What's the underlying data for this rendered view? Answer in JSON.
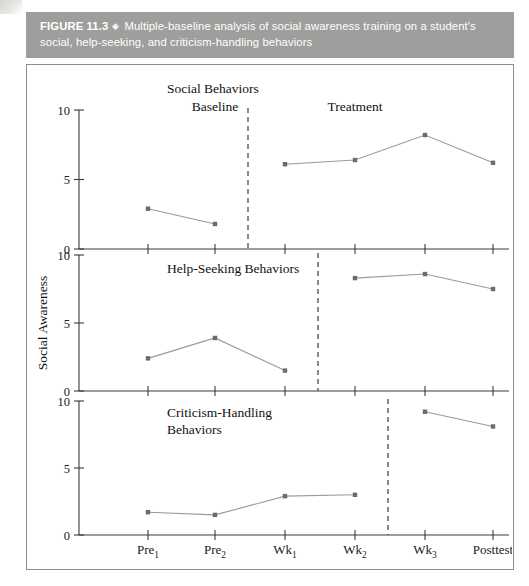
{
  "caption": {
    "figure_number": "FIGURE 11.3",
    "separator_icon": "diamond-bullet-icon",
    "separator_glyph": "◆",
    "text": "Multiple-baseline analysis of social awareness training on a student's social, help-seeking, and criticism-handling behaviors",
    "bar_color": "#9e9e9c",
    "text_color": "#ffffff"
  },
  "chart_data": {
    "type": "line",
    "title": "Multiple-baseline analysis of social awareness training on a student's social, help-seeking, and criticism-handling behaviors",
    "xlabel": "",
    "ylabel": "Social Awareness",
    "x": [
      "Pre1",
      "Pre2",
      "Wk1",
      "Wk2",
      "Wk3",
      "Posttest"
    ],
    "x_tick_labels": [
      {
        "base": "Pre",
        "sub": "1"
      },
      {
        "base": "Pre",
        "sub": "2"
      },
      {
        "base": "Wk",
        "sub": "1"
      },
      {
        "base": "Wk",
        "sub": "2"
      },
      {
        "base": "Wk",
        "sub": "3"
      },
      {
        "base": "Posttest",
        "sub": ""
      }
    ],
    "ylim": [
      0,
      10
    ],
    "y_ticks": [
      0,
      5,
      10
    ],
    "grid": false,
    "legend": "none",
    "marker": "square",
    "line_color": "#9a9a9a",
    "marker_color": "#6b6b6b",
    "panels": [
      {
        "name": "Social Behaviors",
        "title": "Social Behaviors",
        "phase_labels": [
          {
            "text": "Baseline",
            "at_x": "Pre2"
          },
          {
            "text": "Treatment",
            "at_x": "Wk2"
          }
        ],
        "phase_change_after": "Pre2",
        "segments": [
          {
            "phase": "Baseline",
            "x": [
              "Pre1",
              "Pre2"
            ],
            "values": [
              2.9,
              1.8
            ]
          },
          {
            "phase": "Treatment",
            "x": [
              "Wk1",
              "Wk2",
              "Wk3",
              "Posttest"
            ],
            "values": [
              6.1,
              6.4,
              8.2,
              6.2
            ]
          }
        ]
      },
      {
        "name": "Help-Seeking Behaviors",
        "title": "Help-Seeking Behaviors",
        "phase_labels": [],
        "phase_change_after": "Wk1",
        "segments": [
          {
            "phase": "Baseline",
            "x": [
              "Pre1",
              "Pre2",
              "Wk1"
            ],
            "values": [
              2.4,
              3.9,
              1.5
            ]
          },
          {
            "phase": "Treatment",
            "x": [
              "Wk2",
              "Wk3",
              "Posttest"
            ],
            "values": [
              8.3,
              8.6,
              7.5
            ]
          }
        ]
      },
      {
        "name": "Criticism-Handling Behaviors",
        "title": "Criticism-Handling Behaviors",
        "title_line1": "Criticism-Handling",
        "title_line2": "Behaviors",
        "phase_labels": [],
        "phase_change_after": "Wk2",
        "segments": [
          {
            "phase": "Baseline",
            "x": [
              "Pre1",
              "Pre2",
              "Wk1",
              "Wk2"
            ],
            "values": [
              1.7,
              1.5,
              2.9,
              3.0
            ]
          },
          {
            "phase": "Treatment",
            "x": [
              "Wk3",
              "Posttest"
            ],
            "values": [
              9.2,
              8.1
            ]
          }
        ]
      }
    ]
  }
}
